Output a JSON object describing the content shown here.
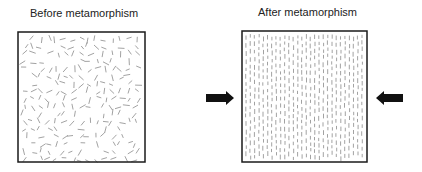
{
  "diagram": {
    "before": {
      "title": "Before metamorphism",
      "box": {
        "x": 18,
        "y": 32,
        "w": 127,
        "h": 130
      },
      "grain_pattern": "random-orientation"
    },
    "after": {
      "title": "After metamorphism",
      "box": {
        "x": 242,
        "y": 31,
        "w": 125,
        "h": 131
      },
      "grain_pattern": "vertical-aligned"
    },
    "arrows": [
      {
        "name": "compression-arrow-left",
        "direction": "right",
        "x": 206,
        "y": 98
      },
      {
        "name": "compression-arrow-right",
        "direction": "left",
        "x": 403,
        "y": 98
      }
    ],
    "colors": {
      "border": "#1a1a1a",
      "grain": "#8a8a8a",
      "arrow": "#111111"
    }
  }
}
